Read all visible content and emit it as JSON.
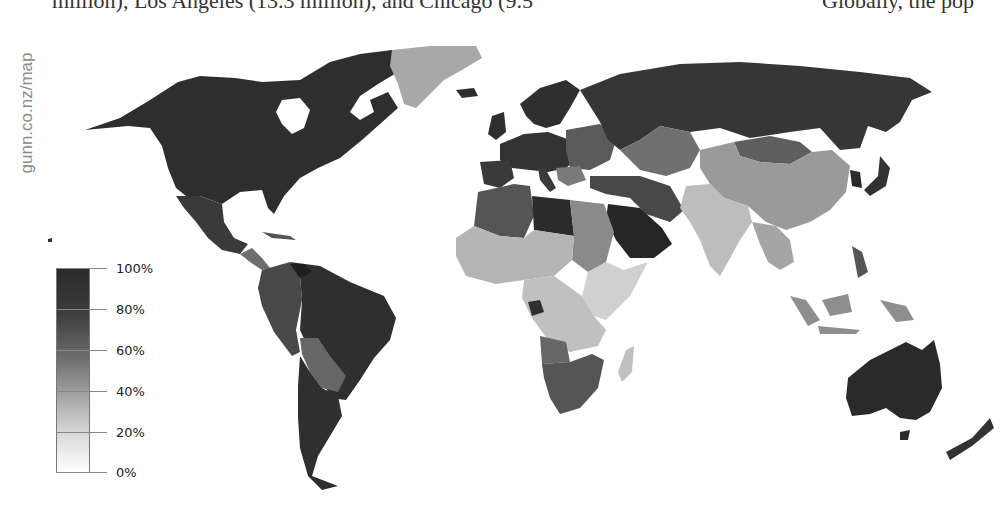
{
  "header": {
    "left_text": "million), Los Angeles (13.3 million), and Chicago (9.5",
    "right_text": "Globally, the pop"
  },
  "watermark": "gunn.co.nz/map",
  "legend": {
    "title": "",
    "gradient_from": "#ffffff",
    "gradient_to": "#2b2b2b",
    "ticks": [
      {
        "label": "100%",
        "pos": 0
      },
      {
        "label": "80%",
        "pos": 20
      },
      {
        "label": "60%",
        "pos": 40
      },
      {
        "label": "40%",
        "pos": 60
      },
      {
        "label": "20%",
        "pos": 80
      },
      {
        "label": "0%",
        "pos": 100
      }
    ]
  },
  "map": {
    "type": "choropleth",
    "projection": "world",
    "color_scale": "grayscale",
    "regions": [
      {
        "name": "North America (USA/Canada)",
        "shade": "#2e2e2e"
      },
      {
        "name": "Mexico",
        "shade": "#3a3a3a"
      },
      {
        "name": "Central America",
        "shade": "#6e6e6e"
      },
      {
        "name": "Greenland",
        "shade": "#a8a8a8"
      },
      {
        "name": "South America (Brazil/Argentina/Chile)",
        "shade": "#2f2f2f"
      },
      {
        "name": "Andean (Peru/Colombia)",
        "shade": "#484848"
      },
      {
        "name": "Bolivia/Paraguay",
        "shade": "#666666"
      },
      {
        "name": "Europe (west/north)",
        "shade": "#333333"
      },
      {
        "name": "Eastern Europe",
        "shade": "#4d4d4d"
      },
      {
        "name": "Russia",
        "shade": "#363636"
      },
      {
        "name": "Central Asia",
        "shade": "#707070"
      },
      {
        "name": "Mongolia",
        "shade": "#5e5e5e"
      },
      {
        "name": "China",
        "shade": "#9a9a9a"
      },
      {
        "name": "Korea/Japan",
        "shade": "#333333"
      },
      {
        "name": "South Asia (India)",
        "shade": "#bdbdbd"
      },
      {
        "name": "Southeast Asia",
        "shade": "#8e8e8e"
      },
      {
        "name": "North Africa (Libya)",
        "shade": "#2b2b2b"
      },
      {
        "name": "North Africa (Algeria/Morocco)",
        "shade": "#555555"
      },
      {
        "name": "Egypt/Sudan",
        "shade": "#8a8a8a"
      },
      {
        "name": "Sahel/West Africa",
        "shade": "#b5b5b5"
      },
      {
        "name": "Central/East Africa",
        "shade": "#c8c8c8"
      },
      {
        "name": "Angola",
        "shade": "#666666"
      },
      {
        "name": "Southern Africa",
        "shade": "#555555"
      },
      {
        "name": "Madagascar",
        "shade": "#c0c0c0"
      },
      {
        "name": "Middle East (Saudi Arabia)",
        "shade": "#262626"
      },
      {
        "name": "Iran/Turkey",
        "shade": "#484848"
      },
      {
        "name": "Australia",
        "shade": "#2a2a2a"
      },
      {
        "name": "New Zealand",
        "shade": "#333333"
      }
    ]
  }
}
